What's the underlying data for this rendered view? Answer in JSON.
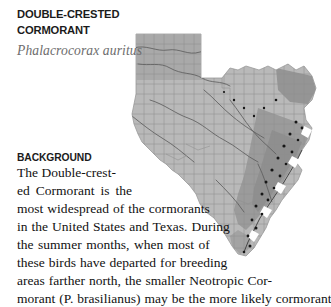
{
  "species": {
    "common_name": "DOUBLE-CRESTED CORMORANT",
    "common_name_line_1": "DOUBLE-CRESTED",
    "common_name_line_2": "CORMORANT",
    "scientific_name": "Phalacrocorax auritus"
  },
  "section": {
    "heading": "BACKGROUND",
    "paragraph": "The Double-crested Cormorant is the most widespread of the cormorants in the United States and Texas. During the summer months, when most of these birds have departed for breeding areas farther north, the smaller Neotropic Cormorant (P. brasilianus) may be the more likely cormorant...",
    "lines": [
      "The Double-crest-",
      "ed Cormorant is the",
      "most widespread of the cormorants",
      "in the United States and Texas. During",
      "the summer months, when most of",
      "these birds have departed for breeding",
      "areas farther north, the smaller Neotropic Cor-",
      "morant (P. brasilianus) may be the more likely cormorant"
    ]
  },
  "map": {
    "name": "texas-distribution-map",
    "region": "Texas",
    "description": "Grayscale Texas county map showing Double-crested Cormorant distribution",
    "colors": {
      "base_fill": "#b9b9b9",
      "shaded_fill": "#9a9a9a",
      "dark_fill": "#8c8c8c",
      "county_line": "#8a8a8a",
      "river_line": "#5a5a5a",
      "record_dot": "#1a1a1a",
      "background": "#ffffff"
    },
    "legend": {
      "base_label": "range",
      "shaded_label": "higher concentration",
      "dot_label": "occurrence record"
    }
  }
}
